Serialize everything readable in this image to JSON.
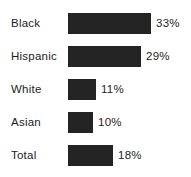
{
  "chart_data": {
    "type": "bar",
    "orientation": "horizontal",
    "title": "",
    "subtitle": "",
    "xlabel": "",
    "ylabel": "",
    "grid": false,
    "legend": null,
    "axis_visible": false,
    "xlim": [
      0,
      33
    ],
    "categories": [
      "Black",
      "Hispanic",
      "White",
      "Asian",
      "Total"
    ],
    "values": [
      33,
      29,
      11,
      10,
      18
    ],
    "value_labels": [
      "33%",
      "29%",
      "11%",
      "10%",
      "18%"
    ],
    "bar_color": "#232323",
    "text_color": "#1d1d1d",
    "background_color": "#ffffff"
  },
  "layout": {
    "bar_left_px": 68,
    "bar_height_px": 21,
    "row_pitch_px": 33,
    "first_row_top_px": 13,
    "px_per_unit": 2.5,
    "label_gap_px": 5
  }
}
